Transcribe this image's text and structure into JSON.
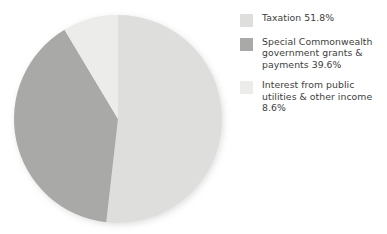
{
  "chart_data": {
    "type": "pie",
    "title": "",
    "subtitle": "",
    "xlabel": "",
    "ylabel": "",
    "grid": false,
    "legend_position": "right",
    "start_angle_deg": 0,
    "direction": "clockwise",
    "categories": [
      "Taxation",
      "Special Commonwealth government grants & payments",
      "Interest from public utilities & other income"
    ],
    "values": [
      51.8,
      39.6,
      8.6
    ],
    "value_unit": "%",
    "colors": [
      "#dededc",
      "#a9a9a7",
      "#ececea"
    ],
    "slices": [
      {
        "label": "Taxation",
        "value": 51.8,
        "display": "Taxation 51.8%",
        "color": "#dededc",
        "start_deg": 0,
        "sweep_deg": 186.48
      },
      {
        "label": "Special Commonwealth government grants & payments",
        "value": 39.6,
        "display": "Special Commonwealth government grants & payments 39.6%",
        "color": "#a9a9a7",
        "start_deg": 186.48,
        "sweep_deg": 142.56
      },
      {
        "label": "Interest from public utilities & other income",
        "value": 8.6,
        "display": "Interest from public utilities & other income 8.6%",
        "color": "#ececea",
        "start_deg": 329.04,
        "sweep_deg": 30.96
      }
    ]
  },
  "legend": {
    "items": [
      {
        "label": "Taxation 51.8%",
        "swatch_color": "#dededc",
        "swatch_name": "legend-swatch-taxation"
      },
      {
        "label": "Special Commonwealth government grants & payments 39.6%",
        "swatch_color": "#a9a9a7",
        "swatch_name": "legend-swatch-special-commonwealth"
      },
      {
        "label": "Interest from public utilities & other income 8.6%",
        "swatch_color": "#ececea",
        "swatch_name": "legend-swatch-interest"
      }
    ]
  },
  "geometry": {
    "center_x": 118,
    "center_y": 119,
    "radius": 104,
    "background": "#ffffff"
  }
}
